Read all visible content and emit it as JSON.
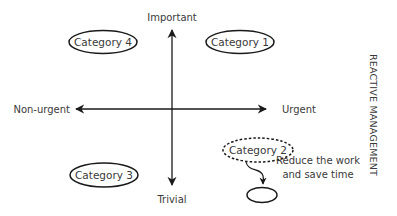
{
  "axes": {
    "top_label": "Important",
    "bottom_label": "Trivial",
    "left_label": "Non-urgent",
    "right_label": "Urgent"
  },
  "categories": [
    {
      "id": "cat4",
      "label": "Category 4",
      "quadrant": "top-left",
      "style": "solid"
    },
    {
      "id": "cat1",
      "label": "Category 1",
      "quadrant": "top-right",
      "style": "solid"
    },
    {
      "id": "cat3",
      "label": "Category 3",
      "quadrant": "bottom-left",
      "style": "solid"
    },
    {
      "id": "cat2",
      "label": "Category 2",
      "quadrant": "bottom-right",
      "style": "dashed"
    }
  ],
  "annotation": {
    "line1": "Reduce the work",
    "line2": "and save time"
  },
  "side_title": "REACTIVE MANAGEMENT",
  "colors": {
    "stroke": "#1a1a1a",
    "text": "#3a3a3a",
    "background": "#ffffff"
  }
}
